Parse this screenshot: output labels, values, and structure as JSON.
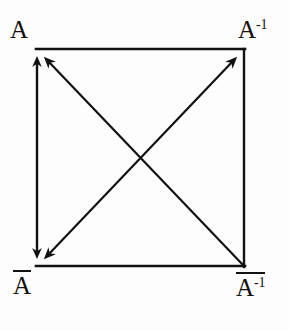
{
  "figure": {
    "background_color": "#fdfdfd",
    "ink_color": "#111111"
  },
  "labels": {
    "top_left": {
      "base": "A",
      "superscript": "",
      "overline": false
    },
    "top_right": {
      "base": "A",
      "superscript": "-1",
      "overline": false
    },
    "bottom_left": {
      "base": "A",
      "superscript": "",
      "overline": true
    },
    "bottom_right": {
      "base": "A",
      "superscript": "-1",
      "overline": true
    }
  },
  "geometry": {
    "square": {
      "left": 36,
      "top": 48,
      "right": 245,
      "bottom": 267
    },
    "center": {
      "x": 140,
      "y": 158
    }
  },
  "edges": [
    {
      "name": "top-edge",
      "from": "top_left",
      "to": "top_right",
      "arrow": "none"
    },
    {
      "name": "right-edge",
      "from": "top_right",
      "to": "bottom_right",
      "arrow": "none"
    },
    {
      "name": "bottom-edge",
      "from": "bottom_left",
      "to": "bottom_right",
      "arrow": "none"
    },
    {
      "name": "left-edge",
      "from": "top_left",
      "to": "bottom_left",
      "arrow": "both"
    },
    {
      "name": "diagonal-bl-tr",
      "from": "bottom_left",
      "to": "top_right",
      "arrow": "both"
    },
    {
      "name": "diagonal-tl-br",
      "from": "top_left",
      "to": "bottom_right",
      "arrow": "start"
    }
  ]
}
